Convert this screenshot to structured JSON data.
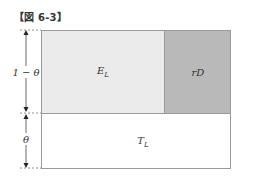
{
  "caption": "【図 6-3】",
  "regions": {
    "top_left": {
      "label": "E",
      "sub": "L",
      "color": "#ebebeb"
    },
    "top_right": {
      "label": "rD",
      "color": "#b9b9b9"
    },
    "bottom": {
      "label": "T",
      "sub": "L",
      "color": "#ffffff"
    }
  },
  "axis": {
    "upper_label": "1 − θ",
    "lower_label": "θ"
  }
}
